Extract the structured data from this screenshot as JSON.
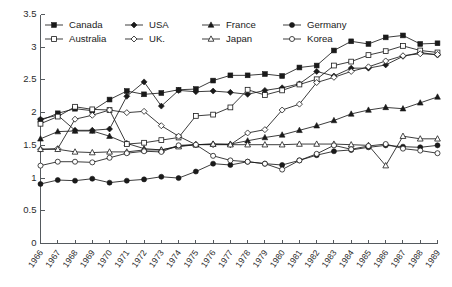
{
  "chart_data": {
    "type": "line",
    "title": "",
    "xlabel": "",
    "ylabel": "",
    "ylim": [
      0,
      3.5
    ],
    "yticks": [
      "0",
      "0.5",
      "1",
      "1.5",
      "2",
      "2.5",
      "3",
      "3.5"
    ],
    "ytick_values": [
      0,
      0.5,
      1,
      1.5,
      2,
      2.5,
      3,
      3.5
    ],
    "grid": false,
    "legend_position": "top-left",
    "categories": [
      "1966",
      "1967",
      "1968",
      "1969",
      "1970",
      "1971",
      "1972",
      "1973",
      "1974",
      "1975",
      "1976",
      "1977",
      "1978",
      "1979",
      "1980",
      "1981",
      "1982",
      "1983",
      "1984",
      "1985",
      "1986",
      "1987",
      "1988",
      "1989"
    ],
    "x": [
      1966,
      1967,
      1968,
      1969,
      1970,
      1971,
      1972,
      1973,
      1974,
      1975,
      1976,
      1977,
      1978,
      1979,
      1980,
      1981,
      1982,
      1983,
      1984,
      1985,
      1986,
      1987,
      1988,
      1989
    ],
    "series": [
      {
        "name": "Canada",
        "marker": "filled-square",
        "values": [
          1.88,
          1.99,
          2.06,
          2.03,
          2.2,
          2.33,
          2.28,
          2.3,
          2.35,
          2.36,
          2.49,
          2.57,
          2.57,
          2.59,
          2.56,
          2.69,
          2.72,
          2.95,
          3.09,
          3.05,
          3.15,
          3.18,
          3.05,
          3.06
        ]
      },
      {
        "name": "USA",
        "marker": "filled-diamond",
        "values": [
          1.9,
          1.96,
          1.73,
          1.73,
          1.75,
          2.25,
          2.47,
          2.1,
          2.34,
          2.32,
          2.33,
          2.31,
          2.28,
          2.34,
          2.38,
          2.44,
          2.63,
          2.56,
          2.68,
          2.68,
          2.73,
          2.86,
          2.92,
          2.88
        ]
      },
      {
        "name": "France",
        "marker": "filled-triangle",
        "values": [
          1.6,
          1.71,
          1.72,
          1.72,
          1.64,
          1.53,
          1.45,
          1.43,
          1.49,
          1.51,
          1.52,
          1.52,
          1.57,
          1.62,
          1.66,
          1.73,
          1.8,
          1.88,
          1.98,
          2.04,
          2.08,
          2.06,
          2.15,
          2.24
        ]
      },
      {
        "name": "Germany",
        "marker": "filled-circle",
        "values": [
          0.91,
          0.97,
          0.96,
          0.99,
          0.93,
          0.96,
          0.98,
          1.02,
          1.0,
          1.1,
          1.22,
          1.2,
          1.25,
          1.22,
          1.2,
          1.27,
          1.35,
          1.41,
          1.43,
          1.47,
          1.5,
          1.48,
          1.47,
          1.5
        ]
      },
      {
        "name": "Australia",
        "marker": "open-square",
        "values": [
          1.83,
          1.94,
          2.09,
          2.05,
          2.04,
          1.52,
          1.54,
          1.58,
          1.62,
          1.95,
          1.97,
          2.08,
          2.35,
          2.27,
          2.34,
          2.43,
          2.51,
          2.72,
          2.78,
          2.88,
          2.94,
          3.02,
          2.95,
          2.92
        ]
      },
      {
        "name": "UK.",
        "marker": "open-diamond",
        "values": [
          1.44,
          1.45,
          1.9,
          1.96,
          2.04,
          2.0,
          2.02,
          1.8,
          1.64,
          1.51,
          1.51,
          1.51,
          1.69,
          1.74,
          2.04,
          2.13,
          2.46,
          2.54,
          2.63,
          2.7,
          2.79,
          2.87,
          2.9,
          2.89
        ]
      },
      {
        "name": "Japan",
        "marker": "open-triangle",
        "values": [
          1.44,
          1.44,
          1.4,
          1.39,
          1.4,
          1.4,
          1.43,
          1.43,
          1.48,
          1.51,
          1.52,
          1.51,
          1.51,
          1.51,
          1.51,
          1.52,
          1.52,
          1.52,
          1.51,
          1.5,
          1.19,
          1.64,
          1.6,
          1.6
        ]
      },
      {
        "name": "Korea",
        "marker": "open-circle",
        "values": [
          1.19,
          1.25,
          1.25,
          1.24,
          1.31,
          1.38,
          1.41,
          1.4,
          1.5,
          1.51,
          1.34,
          1.27,
          1.25,
          1.22,
          1.13,
          1.27,
          1.37,
          1.5,
          1.44,
          1.49,
          1.52,
          1.45,
          1.42,
          1.38
        ]
      }
    ]
  },
  "legend": {
    "rows": [
      [
        "Canada",
        "USA",
        "France",
        "Germany"
      ],
      [
        "Australia",
        "UK.",
        "Japan",
        "Korea"
      ]
    ]
  }
}
